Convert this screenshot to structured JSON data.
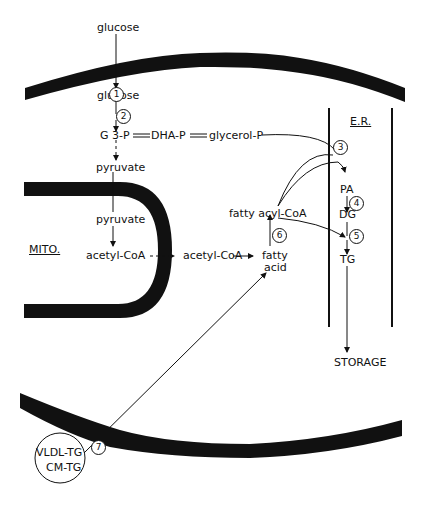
{
  "diagram": {
    "compartments": {
      "mitochondrion": "MITO.",
      "er": "E.R."
    },
    "metabolites": {
      "glucose_out": "glucose",
      "glucose_in": "glucose",
      "g3p": "G 3-P",
      "dhap": "DHA-P",
      "glycerol_p": "glycerol-P",
      "pyruvate_cyto": "pyruvate",
      "pyruvate_mito": "pyruvate",
      "acetyl_coa_mito": "acetyl-CoA",
      "acetyl_coa_cyto": "acetyl-CoA",
      "fatty_acyl_coa": "fatty acyl-CoA",
      "fatty_acid_1": "fatty",
      "fatty_acid_2": "acid",
      "pa": "PA",
      "dg": "DG",
      "tg": "TG",
      "storage": "STORAGE",
      "vldl_tg": "VLDL-TG",
      "cm_tg": "CM-TG"
    },
    "steps": [
      "1",
      "2",
      "3",
      "4",
      "5",
      "6",
      "7"
    ],
    "colors": {
      "ink": "#111111",
      "background": "#ffffff"
    }
  }
}
